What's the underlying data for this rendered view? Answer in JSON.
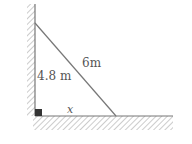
{
  "diagram": {
    "type": "ladder-against-wall",
    "wall_height_label": "4.8 m",
    "ladder_length_label": "6m",
    "ground_distance_label": "x",
    "right_angle_marker": true,
    "colors": {
      "line": "#777777",
      "hatch": "#aaaaaa",
      "marker": "#333333",
      "text": "#555555"
    }
  }
}
